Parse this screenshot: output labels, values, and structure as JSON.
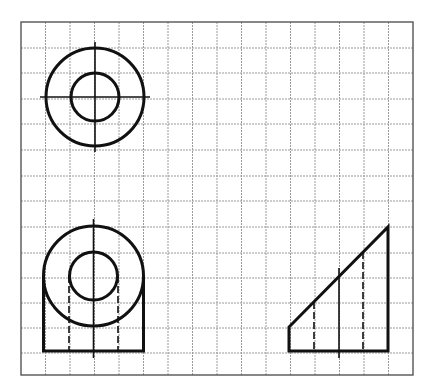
{
  "figure": {
    "type": "orthographic-three-view-drawing",
    "colors": {
      "background": "#ffffff",
      "grid": "#9a9a9a",
      "border": "#555555",
      "ink": "#111111"
    },
    "grid": {
      "columns": 16,
      "rows": 14,
      "x_lines": [
        21,
        45.5,
        70,
        94.5,
        119,
        143.5,
        168,
        192.5,
        217,
        241.5,
        266,
        290.5,
        315,
        339.5,
        364,
        388.5,
        413
      ],
      "y_lines": [
        22,
        48,
        73,
        99,
        124,
        150,
        176,
        201,
        227,
        253,
        278,
        303,
        328,
        353,
        375
      ]
    },
    "views": {
      "top_view": {
        "center": [
          95,
          97
        ],
        "outer_radius": 49,
        "inner_radius": 24,
        "centerline_h": [
          40,
          150
        ],
        "centerline_v": [
          42,
          152
        ]
      },
      "front_view": {
        "circle_center": [
          93.5,
          276
        ],
        "outer_radius": 50,
        "inner_radius": 24,
        "base_rect": {
          "left": 43.5,
          "right": 143.5,
          "top": 276,
          "bottom": 351
        },
        "hidden_lines_x": [
          69,
          118
        ],
        "hidden_lines_y": [
          276,
          351
        ],
        "centerline_v": [
          219,
          358
        ]
      },
      "side_view": {
        "polygon": [
          [
            289,
            351
          ],
          [
            289,
            327
          ],
          [
            388,
            227
          ],
          [
            388,
            351
          ]
        ],
        "hidden_lines": [
          {
            "x": 314,
            "y1": 302,
            "y2": 351
          },
          {
            "x": 363,
            "y1": 252,
            "y2": 351
          }
        ],
        "centerline": {
          "x": 339,
          "y1": 268,
          "y2": 358
        }
      }
    }
  }
}
